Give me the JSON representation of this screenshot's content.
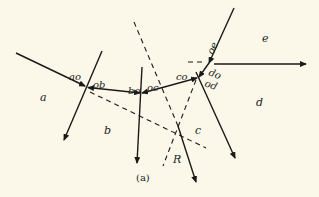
{
  "figure": {
    "caption": "(a)",
    "background": "#fbf8e9",
    "line_color": "#1a1a1a"
  },
  "regions": {
    "a": "a",
    "b": "b",
    "c": "c",
    "d": "d",
    "e": "e"
  },
  "forces": {
    "ao": "ao",
    "ob": "ob",
    "bo": "bo",
    "oc": "oc",
    "co": "co",
    "do": "do",
    "od": "od",
    "oe": "oe",
    "resultant": "R"
  }
}
